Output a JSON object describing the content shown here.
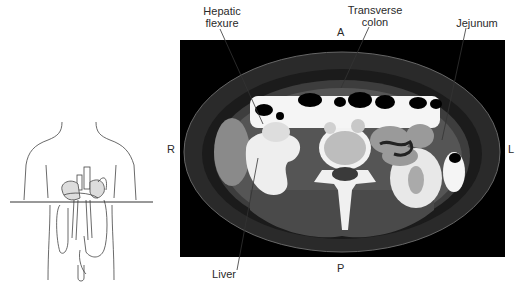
{
  "figure": {
    "labels": {
      "hepatic_flexure": "Hepatic\nflexure",
      "hepatic_line1": "Hepatic",
      "hepatic_line2": "flexure",
      "transverse_line1": "Transverse",
      "transverse_line2": "colon",
      "jejunum": "Jejunum",
      "liver": "Liver"
    },
    "orientation": {
      "anterior": "A",
      "posterior": "P",
      "right": "R",
      "left": "L"
    },
    "panels": {
      "left": "body-outline-diagram-with-transverse-plane-line",
      "right": "axial-ct-abdomen"
    },
    "colors": {
      "background": "#ffffff",
      "ct_background": "#000000",
      "line_art": "#333333"
    }
  }
}
